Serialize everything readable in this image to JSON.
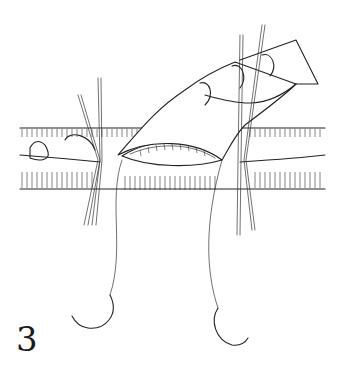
{
  "figure": {
    "panel_number": "3",
    "elements": [
      "vessel-left-segment",
      "vessel-right-segment",
      "anastomosis-opening",
      "gloved-finger",
      "stay-sutures-left",
      "stay-sutures-right",
      "curved-needle-left",
      "curved-needle-right"
    ],
    "colors": {
      "ink": "#222222",
      "background": "#ffffff"
    }
  }
}
